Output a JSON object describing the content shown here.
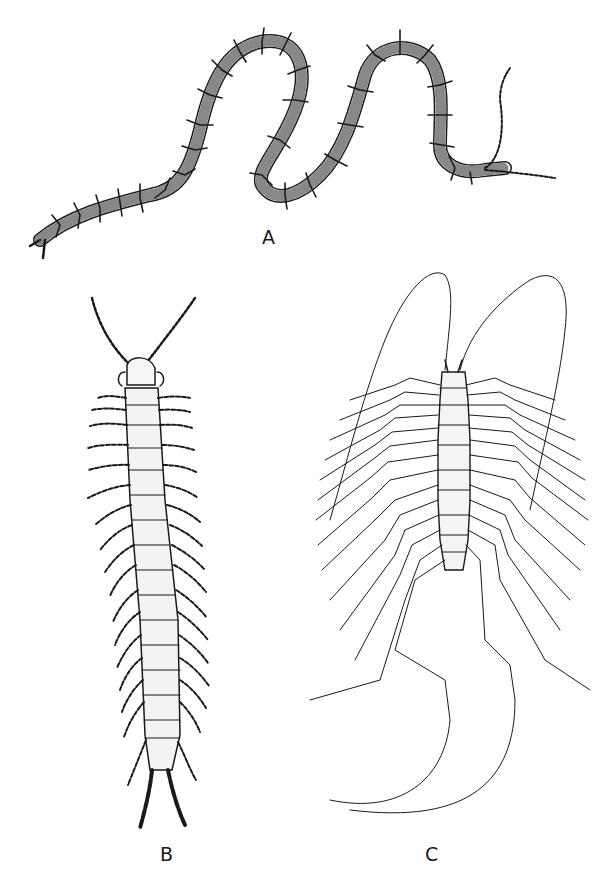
{
  "plate": {
    "background": "#ffffff",
    "ink": "#1a1a1a",
    "figures": [
      {
        "id": "A",
        "label": "A",
        "subject": "centipede-coiled-side-view"
      },
      {
        "id": "B",
        "label": "B",
        "subject": "centipede-dorsal-view-scolopendra"
      },
      {
        "id": "C",
        "label": "C",
        "subject": "house-centipede-dorsal-view-scutigera"
      }
    ]
  }
}
